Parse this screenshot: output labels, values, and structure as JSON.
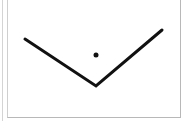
{
  "diagram": {
    "type": "angle",
    "shape": "V",
    "stroke_color": "#111111",
    "stroke_width": 3,
    "points": [
      [
        25,
        39
      ],
      [
        96,
        86
      ],
      [
        162,
        30
      ]
    ],
    "dot": {
      "cx": 96,
      "cy": 55,
      "r": 2.5
    }
  },
  "colors": {
    "background": "#ffffff",
    "border": "#b8b8b8"
  }
}
